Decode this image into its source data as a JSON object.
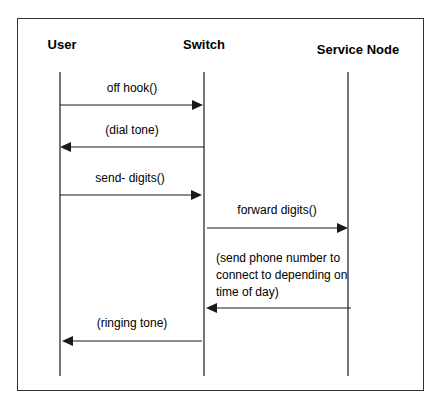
{
  "diagram": {
    "type": "sequence",
    "participants": [
      {
        "id": "user",
        "label": "User",
        "x": 60,
        "label_x": 62,
        "label_y": 49
      },
      {
        "id": "switch",
        "label": "Switch",
        "x": 204,
        "label_x": 204,
        "label_y": 49
      },
      {
        "id": "service_node",
        "label": "Service Node",
        "x": 348,
        "label_x": 358,
        "label_y": 54
      }
    ],
    "lifeline": {
      "top": 72,
      "bottom": 376
    },
    "messages": [
      {
        "from": "user",
        "to": "switch",
        "lines": [
          "off hook()"
        ],
        "y": 105,
        "x1": 60,
        "x2": 203,
        "text_x": 132,
        "text_y": [
          92
        ]
      },
      {
        "from": "switch",
        "to": "user",
        "lines": [
          "(dial tone)"
        ],
        "y": 147,
        "x1": 204,
        "x2": 60,
        "text_x": 132,
        "text_y": [
          134
        ]
      },
      {
        "from": "user",
        "to": "switch",
        "lines": [
          "send- digits()"
        ],
        "y": 195,
        "x1": 60,
        "x2": 202,
        "text_x": 130,
        "text_y": [
          182
        ]
      },
      {
        "from": "switch",
        "to": "service_node",
        "lines": [
          "forward  digits()"
        ],
        "y": 228,
        "x1": 207,
        "x2": 348,
        "text_x": 277,
        "text_y": [
          214
        ]
      },
      {
        "from": "service_node",
        "to": "switch",
        "lines": [
          "(send phone number to",
          "connect to depending on",
          "time of day)"
        ],
        "y": 308,
        "x1": 351,
        "x2": 206,
        "text_x": 216,
        "text_y": [
          262,
          279,
          296
        ],
        "align": "start"
      },
      {
        "from": "switch",
        "to": "user",
        "lines": [
          "(ringing tone)"
        ],
        "y": 341,
        "x1": 202,
        "x2": 62,
        "text_x": 132,
        "text_y": [
          327
        ]
      }
    ],
    "colors": {
      "line": "#1a1a1a",
      "frame": "#333333",
      "background": "#ffffff"
    }
  }
}
